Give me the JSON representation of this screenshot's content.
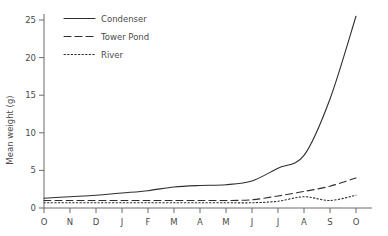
{
  "chart_data": {
    "type": "line",
    "title": "",
    "xlabel": "",
    "ylabel": "Mean weight (g)",
    "x": [
      "O",
      "N",
      "D",
      "J",
      "F",
      "M",
      "A",
      "M",
      "J",
      "J",
      "A",
      "S",
      "O"
    ],
    "xtick_labels": [
      "O",
      "N",
      "D",
      "J",
      "F",
      "M",
      "A",
      "M",
      "J",
      "J",
      "A",
      "S",
      "O"
    ],
    "ytick_labels": [
      "0",
      "5",
      "10",
      "15",
      "20",
      "25"
    ],
    "ytick_values": [
      0,
      5,
      10,
      15,
      20,
      25
    ],
    "ylim": [
      0,
      27
    ],
    "grid": false,
    "legend_position": "top-left",
    "series": [
      {
        "name": "Condenser",
        "style": "solid",
        "values": [
          1.3,
          1.5,
          1.7,
          2.0,
          2.3,
          2.8,
          3.0,
          3.1,
          3.6,
          5.3,
          7.0,
          14.5,
          25.5
        ]
      },
      {
        "name": "Tower Pond",
        "style": "dashed",
        "values": [
          1.0,
          1.0,
          1.0,
          1.0,
          1.0,
          1.0,
          1.0,
          1.0,
          1.1,
          1.6,
          2.2,
          2.9,
          4.0
        ]
      },
      {
        "name": "River",
        "style": "dotted",
        "values": [
          0.7,
          0.7,
          0.7,
          0.7,
          0.7,
          0.7,
          0.7,
          0.7,
          0.7,
          0.9,
          1.5,
          1.0,
          1.7
        ]
      }
    ]
  },
  "legend": {
    "items": [
      {
        "label": "Condenser"
      },
      {
        "label": "Tower Pond"
      },
      {
        "label": "River"
      }
    ]
  },
  "axes": {
    "y_title": "Mean weight (g)"
  }
}
